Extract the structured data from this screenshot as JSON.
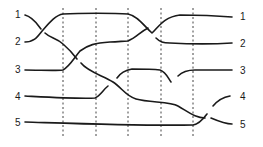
{
  "diagram": {
    "type": "braid-diagram",
    "left_labels": [
      "1",
      "2",
      "3",
      "4",
      "5"
    ],
    "right_labels": [
      "1",
      "2",
      "3",
      "4",
      "5"
    ],
    "dashed_dividers": 5,
    "line_color": "#1a1a1a",
    "strands": [
      {
        "from": "1",
        "to": "5"
      },
      {
        "from": "2",
        "to": "1"
      },
      {
        "from": "3",
        "to": "2"
      },
      {
        "from": "4",
        "to": "3"
      },
      {
        "from": "5",
        "to": "4"
      }
    ]
  }
}
